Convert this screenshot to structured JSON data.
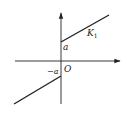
{
  "diagram": {
    "type": "piecewise-linear-characteristic",
    "colors": {
      "stroke": "#222222",
      "background": "#ffffff"
    },
    "labels": {
      "origin": "O",
      "positive_intercept": "a",
      "negative_intercept": "−a",
      "slope": "K",
      "slope_subscript": "1"
    },
    "geometry": {
      "origin": [
        61,
        61
      ],
      "x_axis": {
        "from": [
          15,
          61
        ],
        "to": [
          120,
          61
        ]
      },
      "y_axis": {
        "from": [
          61,
          104
        ],
        "to": [
          61,
          13
        ]
      },
      "upper_segment": {
        "from": [
          61,
          42
        ],
        "to": [
          109,
          15
        ]
      },
      "lower_segment": {
        "from": [
          61,
          76
        ],
        "to": [
          14,
          104
        ]
      }
    }
  }
}
